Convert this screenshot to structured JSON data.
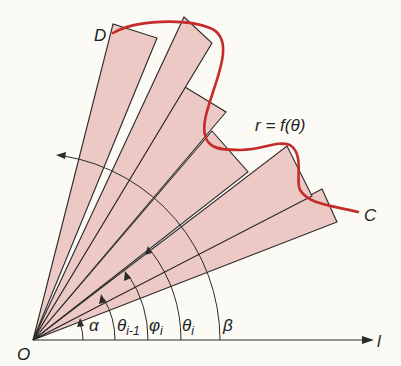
{
  "figure": {
    "origin_label": "O",
    "axis_label": "l",
    "curve_label": "r = f(θ)",
    "start_point_label": "D",
    "end_point_label": "C",
    "angle_labels": {
      "alpha": "α",
      "theta_prev": "θ",
      "theta_prev_sub": "i-1",
      "phi": "φ",
      "phi_sub": "i",
      "theta": "θ",
      "theta_sub": "i",
      "beta": "β"
    },
    "colors": {
      "background": "#fbfaf5",
      "sector_fill": "#ecc9c4",
      "curve": "#c42b2b",
      "lines": "#2a2a2a"
    },
    "sector_count": 6
  }
}
